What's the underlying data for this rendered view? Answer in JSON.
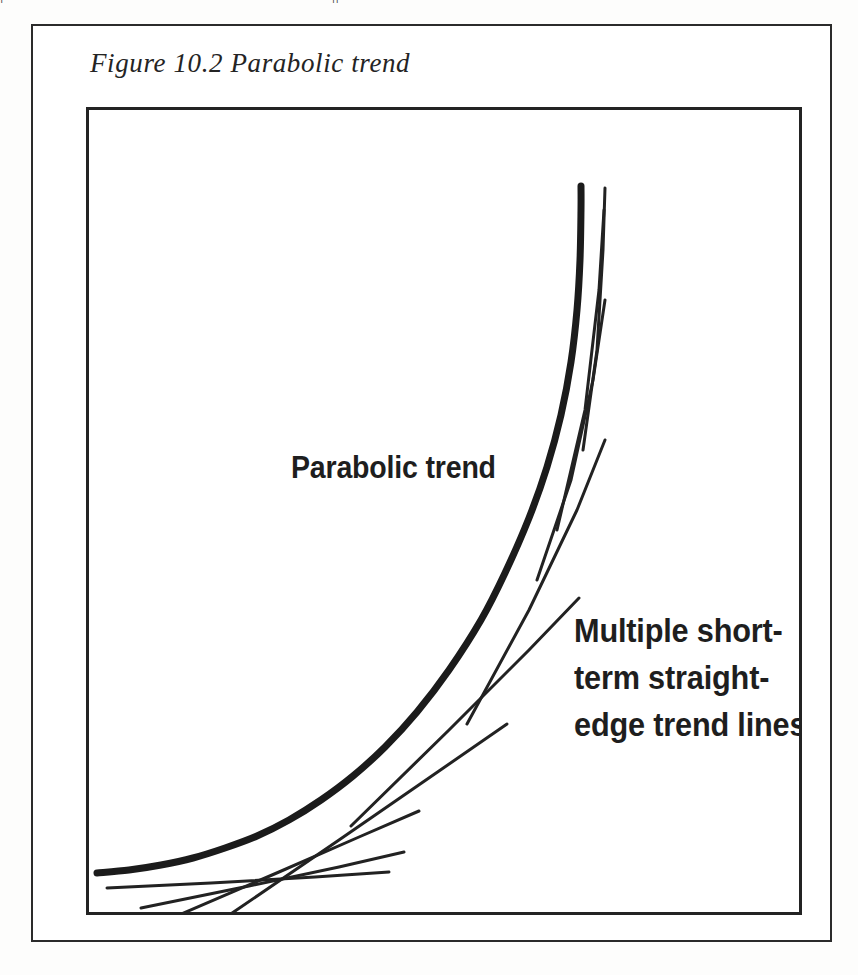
{
  "page": {
    "bleed_text": "|                                                                     ||",
    "background_color": "#fdfdfc",
    "ink_color": "#1e1e1e"
  },
  "figure": {
    "caption": "Figure 10.2 Parabolic trend",
    "frame_border_color": "#2b2b2b",
    "plot_border_color": "#232323"
  },
  "labels": {
    "parabolic": "Parabolic trend",
    "multiple": "Multiple short-\nterm straight-\nedge trend lines"
  },
  "chart_data": {
    "type": "line",
    "title": "Figure 10.2 Parabolic trend",
    "subtitle": "",
    "xlabel": "",
    "ylabel": "",
    "xlim": [
      0,
      716
    ],
    "ylim": [
      0,
      808
    ],
    "grid": false,
    "legend_position": "none",
    "axis_ticks": false,
    "annotations": [
      {
        "text": "Parabolic trend",
        "x": 202,
        "y": 342,
        "style": "bold-condensed-sans",
        "font_size": 31
      },
      {
        "text": "Multiple short-term straight-edge trend lines",
        "x": 485,
        "y": 498,
        "style": "bold-condensed-sans",
        "font_size": 33
      }
    ],
    "series": [
      {
        "name": "Parabolic trend",
        "role": "main-curve",
        "stroke_width": 7,
        "color": "#1b1b1b",
        "points": [
          [
            8,
            763
          ],
          [
            40,
            760
          ],
          [
            72,
            755
          ],
          [
            104,
            748
          ],
          [
            136,
            738
          ],
          [
            168,
            726
          ],
          [
            200,
            710
          ],
          [
            232,
            690
          ],
          [
            264,
            666
          ],
          [
            296,
            637
          ],
          [
            328,
            602
          ],
          [
            360,
            560
          ],
          [
            392,
            510
          ],
          [
            416,
            463
          ],
          [
            440,
            408
          ],
          [
            458,
            357
          ],
          [
            472,
            305
          ],
          [
            482,
            252
          ],
          [
            488,
            200
          ],
          [
            491,
            150
          ],
          [
            492,
            100
          ],
          [
            492,
            76
          ]
        ]
      },
      {
        "name": "short-term trend line 1",
        "role": "straight-edge",
        "stroke_width": 3,
        "color": "#222222",
        "points": [
          [
            18,
            778
          ],
          [
            122,
            773
          ],
          [
            226,
            767
          ],
          [
            300,
            762
          ]
        ]
      },
      {
        "name": "short-term trend line 2",
        "role": "straight-edge",
        "stroke_width": 3,
        "color": "#222222",
        "points": [
          [
            52,
            798
          ],
          [
            160,
            776
          ],
          [
            250,
            757
          ],
          [
            315,
            742
          ]
        ]
      },
      {
        "name": "short-term trend line 3",
        "role": "straight-edge",
        "stroke_width": 3,
        "color": "#222222",
        "points": [
          [
            90,
            805
          ],
          [
            190,
            762
          ],
          [
            270,
            727
          ],
          [
            330,
            701
          ]
        ]
      },
      {
        "name": "short-term trend line 4",
        "role": "straight-edge",
        "stroke_width": 3,
        "color": "#222222",
        "points": [
          [
            130,
            812
          ],
          [
            250,
            730
          ],
          [
            350,
            661
          ],
          [
            418,
            614
          ]
        ]
      },
      {
        "name": "short-term trend line 5",
        "role": "straight-edge",
        "stroke_width": 3,
        "color": "#222222",
        "points": [
          [
            262,
            716
          ],
          [
            360,
            620
          ],
          [
            440,
            540
          ],
          [
            490,
            488
          ]
        ]
      },
      {
        "name": "short-term trend line 6",
        "role": "straight-edge",
        "stroke_width": 3,
        "color": "#222222",
        "points": [
          [
            378,
            614
          ],
          [
            440,
            500
          ],
          [
            488,
            400
          ],
          [
            516,
            330
          ]
        ]
      },
      {
        "name": "short-term trend line 7",
        "role": "straight-edge",
        "stroke_width": 3,
        "color": "#222222",
        "points": [
          [
            448,
            470
          ],
          [
            482,
            370
          ],
          [
            504,
            270
          ],
          [
            516,
            190
          ]
        ]
      },
      {
        "name": "short-term trend line 8",
        "role": "straight-edge",
        "stroke_width": 3,
        "color": "#222222",
        "points": [
          [
            468,
            420
          ],
          [
            496,
            300
          ],
          [
            510,
            180
          ],
          [
            515,
            100
          ]
        ]
      },
      {
        "name": "short-term trend line 9",
        "role": "straight-edge",
        "stroke_width": 3,
        "color": "#222222",
        "points": [
          [
            494,
            340
          ],
          [
            508,
            240
          ],
          [
            514,
            140
          ],
          [
            516,
            78
          ]
        ]
      }
    ]
  }
}
